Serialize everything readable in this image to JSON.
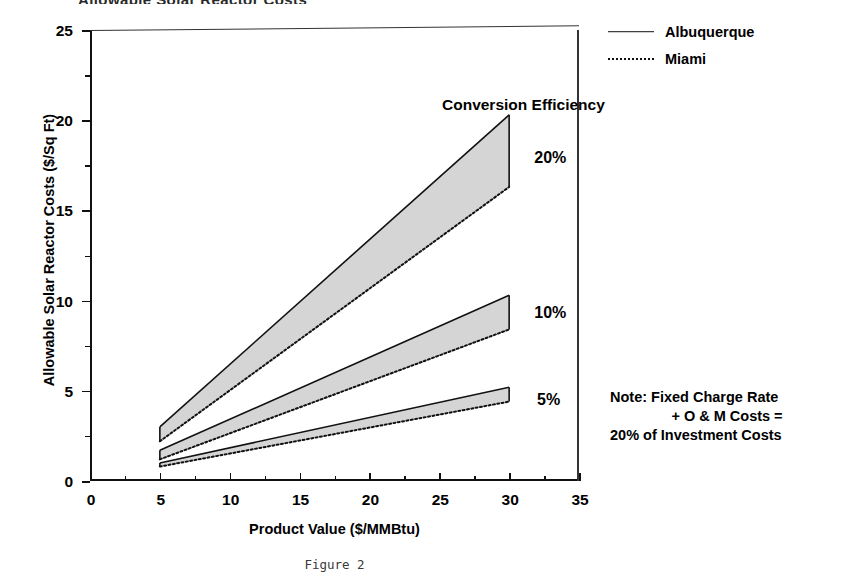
{
  "chart": {
    "type": "area",
    "title": "Allowable Solar Reactor Costs",
    "caption": "Figure 2",
    "xlabel": "Product Value ($/MMBtu)",
    "ylabel": "Allowable Solar Reactor Costs ($/Sq Ft)",
    "xlim": [
      0,
      35
    ],
    "ylim": [
      0,
      25
    ],
    "xticks": [
      0,
      5,
      10,
      15,
      20,
      25,
      30,
      35
    ],
    "xticklabels": [
      "0",
      "5",
      "10",
      "15",
      "20",
      "25",
      "30",
      "35"
    ],
    "xminorticks": [
      2.5,
      7.5,
      12.5,
      17.5,
      22.5,
      27.5,
      32.5
    ],
    "yticks": [
      0,
      5,
      10,
      15,
      20,
      25
    ],
    "yticklabels": [
      "0",
      "5",
      "10",
      "15",
      "20",
      "25"
    ],
    "yminorticks": [
      2.5,
      7.5,
      12.5,
      17.5,
      22.5
    ],
    "grid": false,
    "legend_position": "outside right top",
    "group_label": "Conversion Efficiency",
    "x": [
      5,
      30
    ],
    "bands": [
      {
        "name": "20%",
        "label": "20%",
        "label_x": 31.8,
        "label_y": 17.9,
        "upper_series": "Albuquerque",
        "upper_values": [
          3.0,
          20.3
        ],
        "lower_series": "Miami",
        "lower_values": [
          2.2,
          16.3
        ]
      },
      {
        "name": "10%",
        "label": "10%",
        "label_x": 31.8,
        "label_y": 9.3,
        "upper_series": "Albuquerque",
        "upper_values": [
          1.7,
          10.3
        ],
        "lower_series": "Miami",
        "lower_values": [
          1.2,
          8.4
        ]
      },
      {
        "name": "5%",
        "label": "5%",
        "label_x": 32.0,
        "label_y": 4.5,
        "upper_series": "Albuquerque",
        "upper_values": [
          1.0,
          5.2
        ],
        "lower_series": "Miami",
        "lower_values": [
          0.8,
          4.4
        ]
      }
    ],
    "legend": [
      {
        "label": "Albuquerque",
        "style": "solid"
      },
      {
        "label": "Miami",
        "style": "dotted"
      }
    ],
    "note_lines": [
      "Note:  Fixed Charge Rate",
      "+ O & M Costs =",
      "20% of Investment Costs"
    ],
    "colors": {
      "axis": "#111111",
      "line": "#111111",
      "band_fill": "#c9c9c9",
      "text": "#000000"
    }
  }
}
